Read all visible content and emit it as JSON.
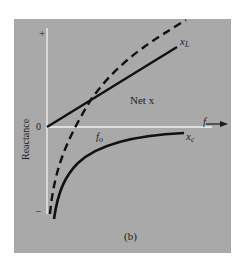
{
  "figure": {
    "caption": "(b)",
    "y_axis_label": "Reactance",
    "y_plus_label": "+",
    "y_zero_label": "0",
    "y_minus_label": "–",
    "x_axis_label": "f",
    "curves": {
      "inductive": {
        "label_main": "x",
        "label_sub": "L",
        "style": "solid"
      },
      "net": {
        "label": "Net x",
        "style": "dashed"
      },
      "capacitive": {
        "label_main": "x",
        "label_sub": "c",
        "style": "solid"
      }
    },
    "resonance_label_main": "f",
    "resonance_label_sub": "o"
  },
  "colors": {
    "background": "#ffffff",
    "panel": "#a9a9a9",
    "axes": "#f2f2f2",
    "curves": "#111111",
    "text": "#1e1e1e"
  }
}
